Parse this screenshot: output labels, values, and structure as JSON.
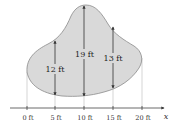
{
  "diagram": {
    "axis_label": "x",
    "ticks": [
      {
        "label": "0 ft",
        "value": 0
      },
      {
        "label": "5 ft",
        "value": 5
      },
      {
        "label": "10 ft",
        "value": 10
      },
      {
        "label": "15 ft",
        "value": 15
      },
      {
        "label": "20 ft",
        "value": 20
      }
    ],
    "measurements": [
      {
        "x": 5,
        "label": "12 ft",
        "length": 12
      },
      {
        "x": 10,
        "label": "19 ft",
        "length": 19
      },
      {
        "x": 15,
        "label": "13 ft",
        "length": 13
      }
    ],
    "colors": {
      "region_fill": "#d9d9d9",
      "region_stroke": "#8a8a8a",
      "lines": "#333333",
      "guides": "#bbbbbb"
    }
  }
}
